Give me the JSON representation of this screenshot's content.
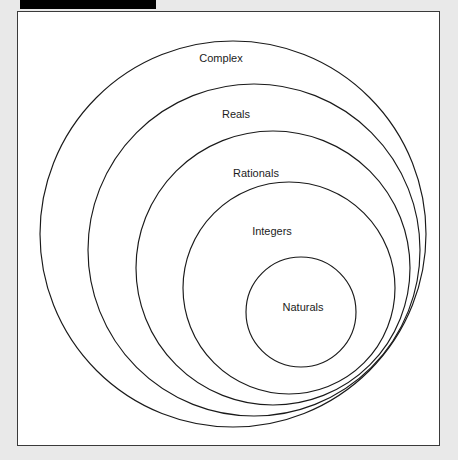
{
  "page": {
    "background_color": "#e9e9e9"
  },
  "redaction_bar": {
    "name": "redacted-title-bar",
    "color": "#000000",
    "label": ""
  },
  "diagram": {
    "name": "number-sets-venn-diagram",
    "frame_background": "#ffffff",
    "frame_border_color": "#3a3a3a",
    "stroke_color": "#1a1a1a",
    "text_color": "#1c1c1c",
    "sets": [
      {
        "label": "Complex",
        "cx": 215,
        "cy": 222,
        "r": 193,
        "label_x": 203,
        "label_y": 47
      },
      {
        "label": "Reals",
        "cx": 236,
        "cy": 238,
        "r": 166,
        "label_x": 218,
        "label_y": 103
      },
      {
        "label": "Rationals",
        "cx": 255,
        "cy": 256,
        "r": 137,
        "label_x": 238,
        "label_y": 162
      },
      {
        "label": "Integers",
        "cx": 271,
        "cy": 276,
        "r": 106,
        "label_x": 254,
        "label_y": 220
      },
      {
        "label": "Naturals",
        "cx": 283,
        "cy": 300,
        "r": 55,
        "label_x": 285,
        "label_y": 296
      }
    ]
  }
}
